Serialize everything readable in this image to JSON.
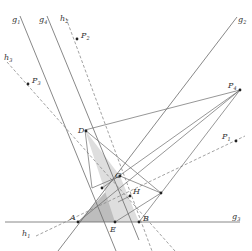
{
  "diagram": {
    "type": "geometric-construction",
    "colors": {
      "line": "#6a6a6a",
      "dashed": "#8a8a8a",
      "fill_dark": "#bdbdbd",
      "fill_light": "#dedede",
      "point": "#222222",
      "label": "#333333"
    },
    "lines": [
      {
        "id": "g1",
        "label": "g",
        "sub": "1",
        "x1": 20,
        "y1": 16,
        "x2": 116,
        "y2": 251,
        "style": "solid",
        "lx": 12,
        "ly": 22
      },
      {
        "id": "g4",
        "label": "g",
        "sub": "4",
        "x1": 47,
        "y1": 16,
        "x2": 139,
        "y2": 240,
        "style": "solid",
        "lx": 39,
        "ly": 22
      },
      {
        "id": "g2",
        "label": "g",
        "sub": "2",
        "x1": 237,
        "y1": 17,
        "x2": 58,
        "y2": 251,
        "style": "solid",
        "lx": 238,
        "ly": 22
      },
      {
        "id": "g3",
        "label": "g",
        "sub": "3",
        "x1": 5,
        "y1": 222,
        "x2": 240,
        "y2": 222,
        "style": "solid",
        "lx": 232,
        "ly": 219
      },
      {
        "id": "h2",
        "label": "h",
        "sub": "2",
        "x1": 66,
        "y1": 18,
        "x2": 152,
        "y2": 251,
        "style": "dashed",
        "lx": 60,
        "ly": 21
      },
      {
        "id": "h3",
        "label": "h",
        "sub": "3",
        "x1": 7,
        "y1": 62,
        "x2": 175,
        "y2": 251,
        "style": "dashed",
        "lx": 4,
        "ly": 60
      },
      {
        "id": "h1",
        "label": "h",
        "sub": "1",
        "x1": 36,
        "y1": 236,
        "x2": 245,
        "y2": 136,
        "style": "dashed",
        "lx": 22,
        "ly": 236
      }
    ],
    "segments": [
      {
        "x1": 85,
        "y1": 130,
        "x2": 240,
        "y2": 90
      },
      {
        "x1": 85,
        "y1": 130,
        "x2": 92,
        "y2": 188
      },
      {
        "x1": 92,
        "y1": 188,
        "x2": 120,
        "y2": 176
      },
      {
        "x1": 85,
        "y1": 130,
        "x2": 161,
        "y2": 193
      },
      {
        "x1": 78,
        "y1": 222,
        "x2": 240,
        "y2": 90
      },
      {
        "x1": 102,
        "y1": 188,
        "x2": 240,
        "y2": 90
      },
      {
        "x1": 139,
        "y1": 222,
        "x2": 240,
        "y2": 90
      },
      {
        "x1": 115,
        "y1": 222,
        "x2": 161,
        "y2": 193
      },
      {
        "x1": 120,
        "y1": 176,
        "x2": 161,
        "y2": 193
      },
      {
        "x1": 130,
        "y1": 196,
        "x2": 118,
        "y2": 202
      }
    ],
    "polygons": [
      {
        "points": "78,222 120,176 115,222",
        "fill": "fill_dark"
      },
      {
        "points": "85,130 120,176 139,222 115,222",
        "fill": "fill_light"
      }
    ],
    "points": [
      {
        "id": "P1",
        "label": "P",
        "sub": "1",
        "x": 236,
        "y": 141,
        "lx": 222,
        "ly": 139
      },
      {
        "id": "P2",
        "label": "P",
        "sub": "2",
        "x": 77,
        "y": 39,
        "lx": 81,
        "ly": 38
      },
      {
        "id": "P3",
        "label": "P",
        "sub": "3",
        "x": 28,
        "y": 84,
        "lx": 32,
        "ly": 83
      },
      {
        "id": "P4",
        "label": "P",
        "sub": "4",
        "x": 240,
        "y": 90,
        "lx": 228,
        "ly": 88
      },
      {
        "id": "D",
        "label": "D",
        "sub": "",
        "x": 86,
        "y": 131,
        "lx": 78,
        "ly": 133
      },
      {
        "id": "C",
        "label": "C",
        "sub": "",
        "x": 120,
        "y": 176,
        "lx": 115,
        "ly": 178
      },
      {
        "id": "H",
        "label": "H",
        "sub": "",
        "x": 130,
        "y": 196,
        "lx": 133,
        "ly": 194
      },
      {
        "id": "A",
        "label": "A",
        "sub": "",
        "x": 78,
        "y": 222,
        "lx": 70,
        "ly": 220
      },
      {
        "id": "E",
        "label": "E",
        "sub": "",
        "x": 115,
        "y": 222,
        "lx": 110,
        "ly": 232
      },
      {
        "id": "B",
        "label": "B",
        "sub": "",
        "x": 139,
        "y": 222,
        "lx": 143,
        "ly": 221
      },
      {
        "id": "X1",
        "label": "",
        "sub": "",
        "x": 161,
        "y": 193,
        "lx": 0,
        "ly": 0
      },
      {
        "id": "X2",
        "label": "",
        "sub": "",
        "x": 102,
        "y": 188,
        "lx": 0,
        "ly": 0
      }
    ]
  }
}
